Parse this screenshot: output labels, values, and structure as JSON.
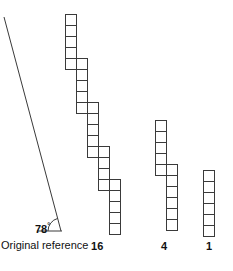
{
  "figure": {
    "background_color": "#ffffff",
    "stroke_color": "#3a3a3a",
    "text_color": "#111111",
    "reference": {
      "angle_value": "78",
      "degree_symbol": "°",
      "caption": "Original reference",
      "ray": {
        "x1": 4,
        "y1": 17,
        "x2": 61,
        "y2": 231
      },
      "baseline": {
        "x1": 37,
        "y1": 231,
        "x2": 62,
        "y2": 231
      },
      "arc": {
        "cx": 61,
        "cy": 231,
        "r": 13
      }
    },
    "columns": [
      {
        "label": "16",
        "name": "column-16",
        "cell": 11,
        "squares": [
          {
            "x": 65,
            "y": 14
          },
          {
            "x": 65,
            "y": 25
          },
          {
            "x": 65,
            "y": 36
          },
          {
            "x": 65,
            "y": 47
          },
          {
            "x": 65,
            "y": 58
          },
          {
            "x": 76,
            "y": 58
          },
          {
            "x": 76,
            "y": 69
          },
          {
            "x": 76,
            "y": 80
          },
          {
            "x": 76,
            "y": 91
          },
          {
            "x": 76,
            "y": 102
          },
          {
            "x": 87,
            "y": 102
          },
          {
            "x": 87,
            "y": 113
          },
          {
            "x": 87,
            "y": 124
          },
          {
            "x": 87,
            "y": 135
          },
          {
            "x": 87,
            "y": 146
          },
          {
            "x": 98,
            "y": 146
          },
          {
            "x": 98,
            "y": 157
          },
          {
            "x": 98,
            "y": 168
          },
          {
            "x": 98,
            "y": 179
          },
          {
            "x": 109,
            "y": 179
          },
          {
            "x": 109,
            "y": 190
          },
          {
            "x": 109,
            "y": 201
          },
          {
            "x": 109,
            "y": 212
          },
          {
            "x": 109,
            "y": 223
          }
        ]
      },
      {
        "label": "4",
        "name": "column-4",
        "cell": 11,
        "squares": [
          {
            "x": 155,
            "y": 120
          },
          {
            "x": 155,
            "y": 131
          },
          {
            "x": 155,
            "y": 142
          },
          {
            "x": 155,
            "y": 153
          },
          {
            "x": 155,
            "y": 164
          },
          {
            "x": 166,
            "y": 164
          },
          {
            "x": 166,
            "y": 175
          },
          {
            "x": 166,
            "y": 186
          },
          {
            "x": 166,
            "y": 197
          },
          {
            "x": 166,
            "y": 208
          },
          {
            "x": 166,
            "y": 219
          }
        ]
      },
      {
        "label": "1",
        "name": "column-1",
        "cell": 11,
        "squares": [
          {
            "x": 203,
            "y": 170
          },
          {
            "x": 203,
            "y": 181
          },
          {
            "x": 203,
            "y": 192
          },
          {
            "x": 203,
            "y": 203
          },
          {
            "x": 203,
            "y": 214
          },
          {
            "x": 203,
            "y": 225
          }
        ]
      }
    ]
  }
}
